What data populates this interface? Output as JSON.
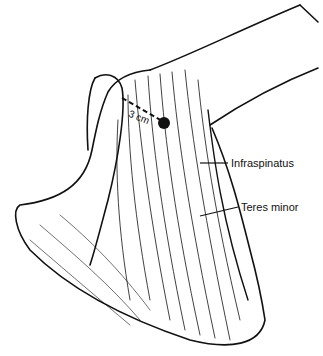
{
  "figure": {
    "measurement": {
      "label": "3 cm"
    },
    "labels": [
      {
        "id": "infraspinatus",
        "text": "Infraspinatus"
      },
      {
        "id": "teres-minor",
        "text": "Teres minor"
      }
    ]
  }
}
